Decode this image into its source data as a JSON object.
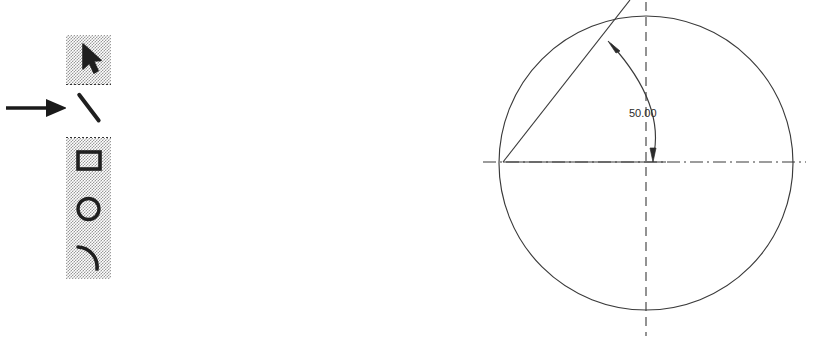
{
  "figure": {
    "background_color": "#ffffff",
    "ink_color": "#2b2b2b",
    "palette_fill_color": "#c0c0c0",
    "selected_fill_color": "#ffffff"
  },
  "annotation": {
    "arrow_name": "callout arrow",
    "points_at": "line-tool",
    "color": "#1a1a1a"
  },
  "tool_palette": {
    "title": "Drawing Tools",
    "selected_tool": "line",
    "groups": [
      {
        "name": "selection",
        "tools": [
          {
            "id": "select",
            "label": "Select",
            "icon": "pointer-arrow-icon",
            "selected": false
          }
        ]
      },
      {
        "name": "linear",
        "tools": [
          {
            "id": "line",
            "label": "Line",
            "icon": "line-icon",
            "selected": true
          }
        ]
      },
      {
        "name": "shapes",
        "tools": [
          {
            "id": "rectangle",
            "label": "Rectangle",
            "icon": "rectangle-icon",
            "selected": false
          },
          {
            "id": "circle",
            "label": "Circle",
            "icon": "circle-icon",
            "selected": false
          },
          {
            "id": "arc",
            "label": "Arc",
            "icon": "arc-icon",
            "selected": false
          }
        ]
      }
    ]
  },
  "drawing": {
    "name": "angular-dimension-drawing",
    "dimension_label": "50.00",
    "entities": [
      {
        "type": "circle",
        "name": "main-circle",
        "style": "solid"
      },
      {
        "type": "centerline",
        "name": "horizontal-centerline",
        "style": "dashed"
      },
      {
        "type": "centerline",
        "name": "vertical-centerline",
        "style": "dashed"
      },
      {
        "type": "line",
        "name": "radius-line",
        "style": "solid"
      },
      {
        "type": "arc",
        "name": "dimension-arc",
        "style": "solid",
        "arrowheads": 2
      }
    ]
  }
}
